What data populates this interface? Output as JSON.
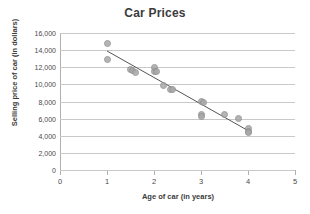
{
  "chart_data": {
    "type": "scatter",
    "title": "Car Prices",
    "xlabel": "Age of car (in years)",
    "ylabel": "Selling price of car (in dollars)",
    "xlim": [
      0,
      5
    ],
    "ylim": [
      0,
      16000
    ],
    "grid": true,
    "legend": "none",
    "x_ticks": [
      0,
      1,
      2,
      3,
      4,
      5
    ],
    "x_tick_labels": [
      "0",
      "1",
      "2",
      "3",
      "4",
      "5"
    ],
    "y_ticks": [
      0,
      2000,
      4000,
      6000,
      8000,
      10000,
      12000,
      14000,
      16000
    ],
    "y_tick_labels": [
      "0",
      "2,000",
      "4,000",
      "6,000",
      "8,000",
      "10,000",
      "12,000",
      "14,000",
      "16,000"
    ],
    "marker_color": "#a8a8a8",
    "trendline_color": "#555555",
    "points": [
      {
        "x": 1.0,
        "y": 14800
      },
      {
        "x": 1.0,
        "y": 12900
      },
      {
        "x": 1.5,
        "y": 11750
      },
      {
        "x": 1.55,
        "y": 11600
      },
      {
        "x": 1.6,
        "y": 11400
      },
      {
        "x": 2.0,
        "y": 11950
      },
      {
        "x": 2.0,
        "y": 11550
      },
      {
        "x": 2.05,
        "y": 11450
      },
      {
        "x": 2.2,
        "y": 9900
      },
      {
        "x": 2.35,
        "y": 9450
      },
      {
        "x": 2.4,
        "y": 9350
      },
      {
        "x": 3.0,
        "y": 8000
      },
      {
        "x": 3.05,
        "y": 7850
      },
      {
        "x": 3.0,
        "y": 6450
      },
      {
        "x": 3.0,
        "y": 6300
      },
      {
        "x": 3.5,
        "y": 6500
      },
      {
        "x": 3.8,
        "y": 6050
      },
      {
        "x": 4.0,
        "y": 4800
      },
      {
        "x": 4.0,
        "y": 4450
      },
      {
        "x": 4.0,
        "y": 4350
      }
    ],
    "trendline": {
      "x_start": 1.0,
      "y_start": 13900,
      "x_end": 4.05,
      "y_end": 4450
    }
  }
}
